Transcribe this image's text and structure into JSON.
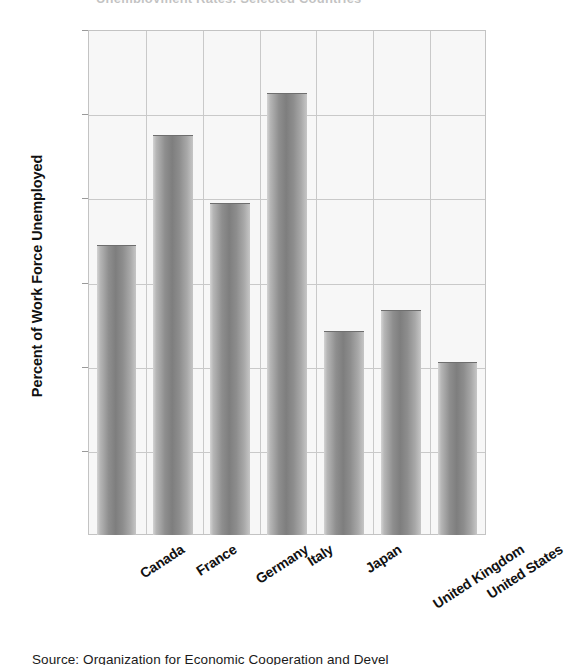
{
  "figure": {
    "title_cropped": "Unemployment Rates, Selected Countries",
    "source_caption": "Source: Organization for Economic Cooperation and Devel"
  },
  "chart_data": {
    "type": "bar",
    "title": "Unemployment Rates, Selected Countries",
    "xlabel": "",
    "ylabel": "Percent of Work Force Unemployed",
    "categories": [
      "Canada",
      "France",
      "Germany",
      "Italy",
      "Japan",
      "United Kingdom",
      "United States"
    ],
    "values": [
      6.9,
      9.5,
      7.9,
      10.5,
      4.85,
      5.35,
      4.1
    ],
    "ylim": [
      0,
      12
    ],
    "yticks": [
      2,
      4,
      6,
      8,
      10,
      12
    ],
    "ytick_labels": [
      "2",
      "4",
      "6",
      "8",
      "10",
      "12"
    ],
    "grid": true,
    "legend": "none",
    "bar_color": "#8e8e8e",
    "plot_background": "#f7f7f7",
    "gridline_color": "#c9c9c9"
  }
}
